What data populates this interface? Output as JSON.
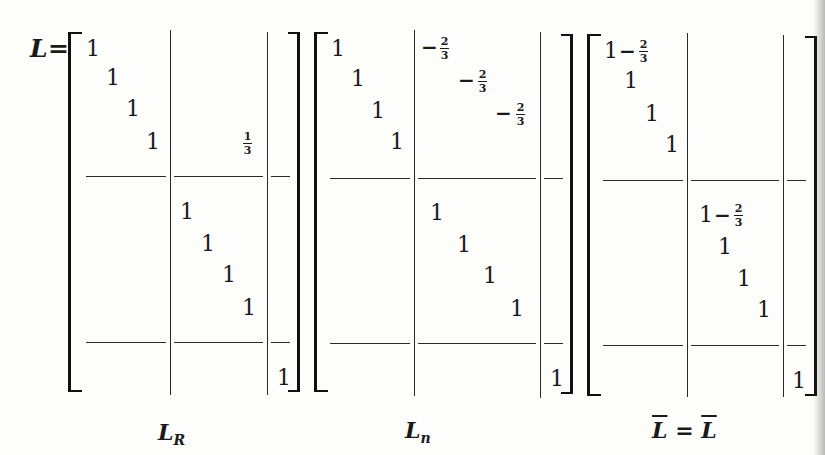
{
  "equation": {
    "lhs_symbol": "L",
    "equals": "=",
    "one": "1",
    "minus": "−",
    "matrices": [
      {
        "id": "L_R",
        "label_main": "L",
        "label_sub": "R",
        "entries": {
          "diag_upper": [
            "1",
            "1",
            "1",
            "1"
          ],
          "offdiag": [
            {
              "num": "1",
              "den": "3"
            }
          ],
          "diag_lower": [
            "1",
            "1",
            "1",
            "1"
          ],
          "corner": "1"
        }
      },
      {
        "id": "L_n",
        "label_main": "L",
        "label_sub": "n",
        "entries": {
          "diag_upper": [
            "1",
            "1",
            "1",
            "1"
          ],
          "offdiag": [
            {
              "sign": "−",
              "num": "2",
              "den": "3"
            },
            {
              "sign": "−",
              "num": "2",
              "den": "3"
            },
            {
              "sign": "−",
              "num": "2",
              "den": "3"
            }
          ],
          "diag_lower": [
            "1",
            "1",
            "1",
            "1"
          ],
          "corner": "1"
        }
      },
      {
        "id": "L_bar",
        "label_text": "L̄ = L̄",
        "label_left": "L",
        "label_eq": "=",
        "label_right": "L",
        "entries": {
          "diag_upper_first": {
            "whole": "1",
            "sign": "−",
            "num": "2",
            "den": "3"
          },
          "diag_upper_rest": [
            "1",
            "1",
            "1"
          ],
          "diag_lower_first": {
            "whole": "1",
            "sign": "−",
            "num": "2",
            "den": "3"
          },
          "diag_lower_rest": [
            "1",
            "1",
            "1"
          ],
          "corner": "1"
        }
      }
    ]
  },
  "colors": {
    "ink": "#1a1a1a",
    "paper": "#fdfdfc"
  }
}
